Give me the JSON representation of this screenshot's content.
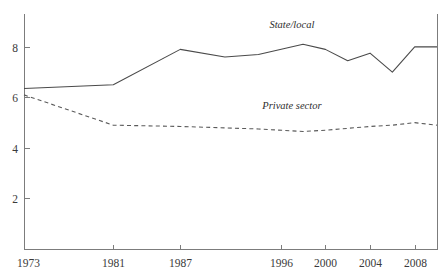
{
  "chart_data": {
    "type": "line",
    "title": "",
    "subtitle": "",
    "xlabel": "",
    "ylabel": "",
    "xlim": [
      1973,
      2010
    ],
    "ylim": [
      0,
      9.3
    ],
    "grid": false,
    "legend_position": "inline-annotation",
    "x_ticks": [
      1973,
      1981,
      1987,
      1996,
      2000,
      2004,
      2008
    ],
    "x_tick_labels": [
      "1973",
      "1981",
      "1987",
      "1996",
      "2000",
      "2004",
      "2008"
    ],
    "y_ticks": [
      2,
      4,
      6,
      8
    ],
    "y_tick_labels": [
      "2",
      "4",
      "6",
      "8"
    ],
    "series": [
      {
        "name": "State/local",
        "style": "solid",
        "color": "#4a4a4a",
        "label_x": 1997,
        "label_y": 8.75,
        "x": [
          1973,
          1981,
          1987,
          1991,
          1994,
          1998,
          2000,
          2002,
          2004,
          2006,
          2008,
          2010
        ],
        "values": [
          6.35,
          6.5,
          7.9,
          7.6,
          7.7,
          8.1,
          7.9,
          7.45,
          7.75,
          7.0,
          8.0,
          8.0
        ]
      },
      {
        "name": "Private sector",
        "style": "dashed",
        "color": "#5a5a5a",
        "label_x": 1997,
        "label_y": 5.55,
        "x": [
          1973,
          1981,
          1987,
          1994,
          1998,
          2000,
          2004,
          2006,
          2008,
          2010
        ],
        "values": [
          6.1,
          4.9,
          4.85,
          4.75,
          4.65,
          4.7,
          4.85,
          4.9,
          5.0,
          4.9
        ]
      }
    ]
  },
  "layout": {
    "plot_left": 24,
    "plot_right": 437,
    "plot_top": 14,
    "plot_bottom": 249
  }
}
